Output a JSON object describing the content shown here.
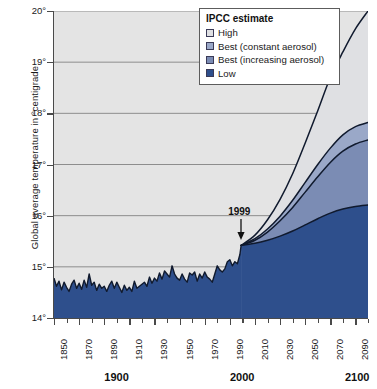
{
  "chart_data": {
    "type": "area",
    "title": "",
    "xlabel": "",
    "ylabel": "Global average temperature in °centigrade",
    "xlim": [
      1850,
      2100
    ],
    "ylim": [
      14,
      20
    ],
    "grid": true,
    "legend_position": "top-right",
    "y_ticks": [
      "14°",
      "15°",
      "16°",
      "17°",
      "18°",
      "19°",
      "20°"
    ],
    "y_tick_values": [
      14,
      15,
      16,
      17,
      18,
      19,
      20
    ],
    "x_ticks_minor": [
      1850,
      1860,
      1870,
      1880,
      1890,
      1900,
      1910,
      1920,
      1930,
      1940,
      1950,
      1960,
      1970,
      1980,
      1990,
      2000,
      2010,
      2020,
      2030,
      2040,
      2050,
      2060,
      2070,
      2080,
      2090,
      2100
    ],
    "x_tick_labels": [
      "1850",
      "1870",
      "1890",
      "1910",
      "1930",
      "1950",
      "1970",
      "1990",
      "2010",
      "2030",
      "2050",
      "2070",
      "2090"
    ],
    "x_tick_label_values": [
      1850,
      1870,
      1890,
      1910,
      1930,
      1950,
      1970,
      1990,
      2010,
      2030,
      2050,
      2070,
      2090
    ],
    "x_bold_labels": [
      {
        "label": "1900",
        "value": 1900
      },
      {
        "label": "2000",
        "value": 2000
      },
      {
        "label": "2100",
        "value": 2100
      }
    ],
    "annotations": [
      {
        "text": "1999",
        "x": 1999,
        "y": 15.45,
        "arrow": true
      }
    ],
    "series": [
      {
        "name": "Observed",
        "type": "line-area",
        "color": "#2e4f8c",
        "x": [
          1850,
          1852,
          1854,
          1856,
          1858,
          1860,
          1862,
          1864,
          1866,
          1868,
          1870,
          1872,
          1874,
          1876,
          1878,
          1880,
          1882,
          1884,
          1886,
          1888,
          1890,
          1892,
          1894,
          1896,
          1898,
          1900,
          1902,
          1904,
          1906,
          1908,
          1910,
          1912,
          1914,
          1916,
          1918,
          1920,
          1922,
          1924,
          1926,
          1928,
          1930,
          1932,
          1934,
          1936,
          1938,
          1940,
          1942,
          1944,
          1946,
          1948,
          1950,
          1952,
          1954,
          1956,
          1958,
          1960,
          1962,
          1964,
          1966,
          1968,
          1970,
          1972,
          1974,
          1976,
          1978,
          1980,
          1982,
          1984,
          1986,
          1988,
          1990,
          1992,
          1994,
          1996,
          1998,
          1999
        ],
        "values": [
          14.78,
          14.62,
          14.72,
          14.55,
          14.7,
          14.6,
          14.52,
          14.66,
          14.74,
          14.58,
          14.68,
          14.56,
          14.74,
          14.6,
          14.86,
          14.64,
          14.7,
          14.54,
          14.66,
          14.58,
          14.62,
          14.52,
          14.64,
          14.72,
          14.58,
          14.7,
          14.6,
          14.5,
          14.64,
          14.54,
          14.6,
          14.52,
          14.72,
          14.58,
          14.62,
          14.66,
          14.7,
          14.62,
          14.8,
          14.68,
          14.78,
          14.72,
          14.88,
          14.76,
          14.92,
          14.86,
          14.8,
          15.02,
          14.86,
          14.78,
          14.74,
          14.86,
          14.76,
          14.7,
          14.88,
          14.84,
          14.9,
          14.72,
          14.86,
          14.78,
          14.9,
          14.8,
          14.76,
          14.7,
          14.86,
          15.02,
          14.94,
          14.9,
          14.96,
          15.1,
          15.14,
          15.02,
          15.1,
          15.06,
          15.24,
          15.42
        ]
      },
      {
        "name": "High",
        "type": "projection",
        "color": "#dfe0e3",
        "x": [
          1999,
          2010,
          2020,
          2030,
          2040,
          2050,
          2060,
          2070,
          2080,
          2090,
          2100
        ],
        "values": [
          15.42,
          15.62,
          15.92,
          16.32,
          16.82,
          17.42,
          18.05,
          18.7,
          19.2,
          19.65,
          20.0
        ]
      },
      {
        "name": "Best (constant aerosol)",
        "type": "projection",
        "color": "#9aa8c8",
        "x": [
          1999,
          2010,
          2020,
          2030,
          2040,
          2050,
          2060,
          2070,
          2080,
          2090,
          2100
        ],
        "values": [
          15.42,
          15.55,
          15.74,
          15.99,
          16.3,
          16.65,
          17.0,
          17.32,
          17.58,
          17.74,
          17.82
        ]
      },
      {
        "name": "Best (increasing aerosol)",
        "type": "projection",
        "color": "#7b8cb4",
        "x": [
          1999,
          2010,
          2020,
          2030,
          2040,
          2050,
          2060,
          2070,
          2080,
          2090,
          2100
        ],
        "values": [
          15.42,
          15.52,
          15.68,
          15.9,
          16.16,
          16.46,
          16.76,
          17.04,
          17.26,
          17.4,
          17.48
        ]
      },
      {
        "name": "Low",
        "type": "projection",
        "color": "#2e4f8c",
        "x": [
          1999,
          2010,
          2020,
          2030,
          2040,
          2050,
          2060,
          2070,
          2080,
          2090,
          2100
        ],
        "values": [
          15.42,
          15.46,
          15.52,
          15.6,
          15.7,
          15.82,
          15.94,
          16.05,
          16.13,
          16.18,
          16.21
        ]
      }
    ]
  },
  "legend": {
    "title": "IPCC estimate",
    "items": [
      {
        "label": "High",
        "color": "#dfe0e3"
      },
      {
        "label": "Best (constant aerosol)",
        "color": "#9aa8c8"
      },
      {
        "label": "Best (increasing aerosol)",
        "color": "#7b8cb4"
      },
      {
        "label": "Low",
        "color": "#2e4f8c"
      }
    ]
  },
  "colors": {
    "plot_background": "#e4e4e4",
    "gridline": "#8d8d8d",
    "axis": "#4a4a4a",
    "curve_outline": "#101a2e",
    "page_background": "#ffffff"
  }
}
